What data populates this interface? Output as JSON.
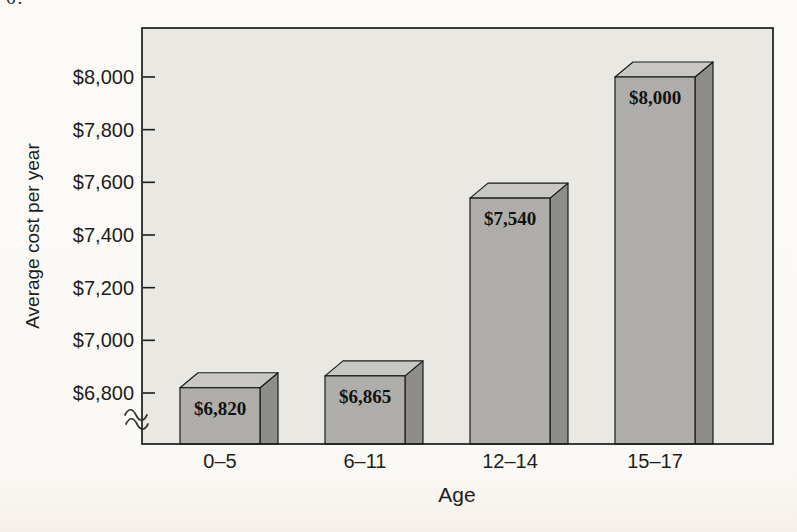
{
  "page": {
    "corner_fragment": "6."
  },
  "chart_data": {
    "type": "bar",
    "title": "",
    "xlabel": "Age",
    "ylabel": "Average cost per year",
    "categories": [
      "0–5",
      "6–11",
      "12–14",
      "15–17"
    ],
    "values": [
      6820,
      6865,
      7540,
      8000
    ],
    "bar_labels": [
      "$6,820",
      "$6,865",
      "$7,540",
      "$8,000"
    ],
    "y_ticks": [
      {
        "value": 6800,
        "label": "$6,800"
      },
      {
        "value": 7000,
        "label": "$7,000"
      },
      {
        "value": 7200,
        "label": "$7,200"
      },
      {
        "value": 7400,
        "label": "$7,400"
      },
      {
        "value": 7600,
        "label": "$7,600"
      },
      {
        "value": 7800,
        "label": "$7,800"
      },
      {
        "value": 8000,
        "label": "$8,000"
      }
    ],
    "ylim_visible": [
      6800,
      8000
    ],
    "y_axis_break": true,
    "grid": false,
    "legend": null,
    "style": "3d-block-bars",
    "colors": {
      "plot_background": "#e9e8e3",
      "bar_front": "#b1b0ac",
      "bar_top": "#c8c7c3",
      "bar_side": "#8e8d89",
      "outline": "#1b1b1b",
      "text": "#1d1d1b"
    }
  }
}
